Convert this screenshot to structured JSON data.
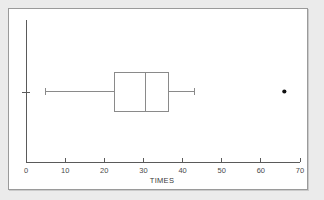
{
  "figure": {
    "background_color": "#ebebeb",
    "panel_color": "#ffffff",
    "panel_border_color": "#9a9a9a",
    "line_color": "#8a8a8a",
    "axis_color": "#5a5a5a",
    "outlier_color": "#111111"
  },
  "chart_data": {
    "type": "box",
    "title": "",
    "xlabel": "TIMES",
    "ylabel": "",
    "orientation": "horizontal",
    "grid": false,
    "legend": null,
    "xlim": [
      0,
      70
    ],
    "xticks": [
      0,
      10,
      20,
      30,
      40,
      50,
      60,
      70
    ],
    "xticklabels": [
      "0",
      "10",
      "20",
      "30",
      "40",
      "50",
      "60",
      "70"
    ],
    "yticks": [],
    "yticklabels": [],
    "boxes": [
      {
        "name": "TIMES",
        "whisker_low": 5,
        "q1": 22.5,
        "median": 30.5,
        "q3": 36.5,
        "whisker_high": 43,
        "outliers": [
          66
        ],
        "center_y_fraction": 0.5
      }
    ]
  }
}
